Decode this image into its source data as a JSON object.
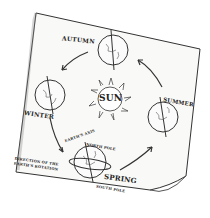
{
  "diagram": {
    "center": {
      "label": "SUN"
    },
    "seasons": [
      {
        "label": "AUTUMN"
      },
      {
        "label": "WINTER"
      },
      {
        "label": "SPRING"
      },
      {
        "label": "SUMMER"
      }
    ],
    "annotations": {
      "axis": "EARTH'S AXIS",
      "north_pole": "NORTH POLE",
      "south_pole": "SOUTH POLE",
      "rotation": "DIRECTION OF THE EARTH'S ROTATION"
    },
    "colors": {
      "ink": "#222222",
      "paper": "#f8f8f6"
    }
  }
}
